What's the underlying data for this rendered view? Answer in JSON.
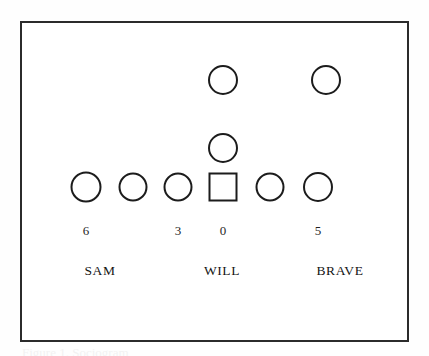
{
  "figure": {
    "background_color": "#fefefe",
    "frame": {
      "border_color": "#2b2b2b",
      "fill_color": "#ffffff"
    },
    "caption": "Figure 1. Sociogram"
  },
  "chart_data": {
    "type": "scatter",
    "title": "",
    "subtitle": "",
    "xlabel": "",
    "ylabel": "",
    "grid": false,
    "legend": "none",
    "shape_colors": {
      "stroke": "#1c1c1c",
      "fill": "none"
    },
    "rows": [
      {
        "row_index": 0,
        "y": 80,
        "nodes": [
          {
            "id": "r0-n0",
            "shape": "circle",
            "x": 223,
            "size": 30
          },
          {
            "id": "r0-n1",
            "shape": "circle",
            "x": 326,
            "size": 30
          }
        ]
      },
      {
        "row_index": 1,
        "y": 148,
        "nodes": [
          {
            "id": "r1-n0",
            "shape": "circle",
            "x": 223,
            "size": 30
          }
        ]
      },
      {
        "row_index": 2,
        "y": 187,
        "nodes": [
          {
            "id": "r2-n0",
            "shape": "circle",
            "x": 86,
            "size": 31
          },
          {
            "id": "r2-n1",
            "shape": "circle",
            "x": 133,
            "size": 29
          },
          {
            "id": "r2-n2",
            "shape": "circle",
            "x": 178,
            "size": 29
          },
          {
            "id": "r2-n3",
            "shape": "square",
            "x": 223,
            "size": 29
          },
          {
            "id": "r2-n4",
            "shape": "circle",
            "x": 270,
            "size": 29
          },
          {
            "id": "r2-n5",
            "shape": "circle",
            "x": 318,
            "size": 30
          }
        ]
      }
    ],
    "count_labels": [
      {
        "text": "6",
        "value": 6,
        "x": 86,
        "y": 230
      },
      {
        "text": "3",
        "value": 3,
        "x": 178,
        "y": 230
      },
      {
        "text": "0",
        "value": 0,
        "x": 223,
        "y": 230
      },
      {
        "text": "5",
        "value": 5,
        "x": 318,
        "y": 230
      }
    ],
    "name_labels": [
      {
        "text": "SAM",
        "x": 100,
        "y": 271
      },
      {
        "text": "WILL",
        "x": 222,
        "y": 271
      },
      {
        "text": "BRAVE",
        "x": 340,
        "y": 271
      }
    ]
  }
}
